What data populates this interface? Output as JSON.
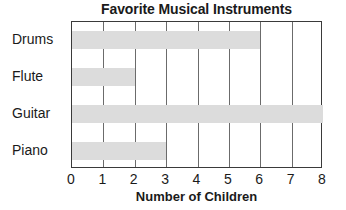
{
  "chart_data": {
    "type": "bar",
    "orientation": "horizontal",
    "title": "Favorite Musical Instruments",
    "xlabel": "Number of Children",
    "ylabel": "",
    "categories": [
      "Drums",
      "Flute",
      "Guitar",
      "Piano"
    ],
    "values": [
      6,
      2,
      8,
      3
    ],
    "xlim": [
      0,
      8
    ],
    "xticks": [
      "0",
      "1",
      "2",
      "3",
      "4",
      "5",
      "6",
      "7",
      "8"
    ],
    "grid": "vertical",
    "legend": "none",
    "bar_color": "#dcdcdc",
    "axis_color": "#3a3a3a",
    "gridline_color": "#6b6b6b",
    "background": "#ffffff"
  }
}
